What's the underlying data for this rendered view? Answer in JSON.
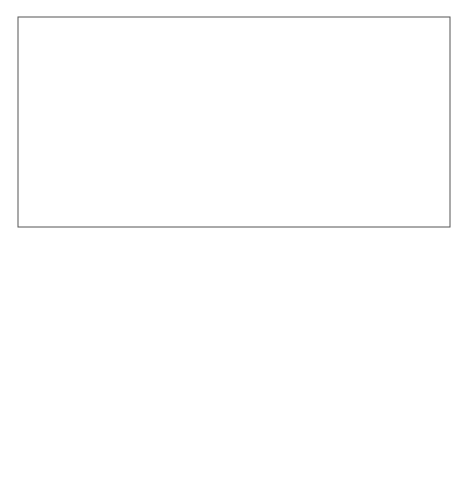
{
  "title": {
    "line1": "Shift of ITCZ and hence",
    "line2": "the SW monsoon rainfall"
  },
  "regions": {
    "mid_holocene_label_line1": "During",
    "mid_holocene_label_line2": "Mid Holocene",
    "india": "INDIA",
    "present": "Present",
    "himalaya": "Himalaya",
    "myanmar": "Myanmar"
  },
  "monsoon_shift": {
    "line1": "Shift of Monsoon",
    "line2": "Pattern after HCO",
    "line3": "Till Present"
  },
  "water_bodies": {
    "arabian_sea": "Arabian Sea",
    "bay_of_bengal": "Bay of Bengal",
    "north_indian_ocean": "North Indian Ocean"
  },
  "arrows": {
    "mid_holocene_arrow_label": "Shift of ITCZ  to right during  Mid-Holocene",
    "present_arrow_label": "Present shft of  ITCZ to during Post-Holocene"
  },
  "colors": {
    "frame": "#555555",
    "afghanistan": "#858585",
    "pakistan": "#e8e8e8",
    "india": "#bdbdbd",
    "india_north": "#d9d9d9",
    "northeast": "#c4c4c4",
    "myanmar": "#d6d6d6",
    "arrow_dark": "#6e6e6e",
    "arrow_light": "#9a9a9a",
    "till_present": "#808080"
  }
}
